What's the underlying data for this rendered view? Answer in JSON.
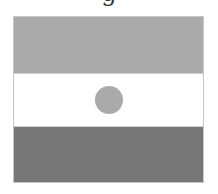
{
  "caption": {
    "text": "g"
  },
  "flag": {
    "name": "Niger",
    "colors": {
      "top_band": "#aaaaaa",
      "middle_band": "#ffffff",
      "bottom_band": "#777777",
      "disc": "#aaaaaa"
    }
  }
}
